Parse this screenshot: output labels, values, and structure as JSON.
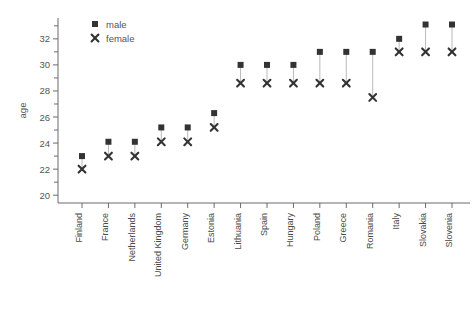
{
  "chart_data": {
    "type": "scatter",
    "title": "",
    "xlabel": "",
    "ylabel": "age",
    "ylim": [
      19.4,
      33.6
    ],
    "yticks": [
      20,
      22,
      24,
      26,
      28,
      30,
      32
    ],
    "yticks_minor": [
      21,
      23,
      25,
      27,
      29,
      31,
      33
    ],
    "grid": false,
    "legend_position": "top-left",
    "categories": [
      "Finland",
      "France",
      "Netherlands",
      "United Kingdom",
      "Germany",
      "Estonia",
      "Lithuania",
      "Spain",
      "Hungary",
      "Poland",
      "Greece",
      "Romania",
      "Italy",
      "Slovakia",
      "Slovenia"
    ],
    "series": [
      {
        "name": "male",
        "marker": "square",
        "color": "#333333",
        "values": [
          23.0,
          24.1,
          24.1,
          25.2,
          25.2,
          26.3,
          30.0,
          30.0,
          30.0,
          31.0,
          31.0,
          31.0,
          32.0,
          33.1,
          33.1
        ]
      },
      {
        "name": "female",
        "marker": "cross",
        "color": "#333333",
        "values": [
          22.0,
          23.0,
          23.0,
          24.1,
          24.1,
          25.2,
          28.6,
          28.6,
          28.6,
          28.6,
          28.6,
          27.5,
          31.0,
          31.0,
          31.0
        ]
      }
    ]
  },
  "legend": {
    "entries": [
      {
        "label": "male",
        "marker": "square"
      },
      {
        "label": "female",
        "marker": "cross"
      }
    ]
  },
  "axes": {
    "y_title": "age"
  }
}
